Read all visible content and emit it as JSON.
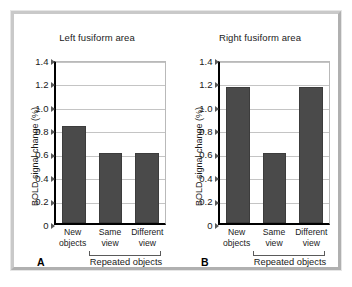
{
  "figure": {
    "frame_border_color": "#c9c9c9",
    "background": "#ffffff"
  },
  "chart_data": [
    {
      "type": "bar",
      "panel_letter": "A",
      "title": "Left fusiform area",
      "xlabel": "Repeated objects",
      "ylabel": "BOLD signal change (%)",
      "categories": [
        "New objects",
        "Same view",
        "Different view"
      ],
      "category_lines": [
        [
          "New",
          "objects"
        ],
        [
          "Same",
          "view"
        ],
        [
          "Different",
          "view"
        ]
      ],
      "values": [
        0.83,
        0.6,
        0.6
      ],
      "ylim": [
        0,
        1.4
      ],
      "yticks": [
        0,
        0.2,
        0.4,
        0.6,
        0.8,
        1.0,
        1.2,
        1.4
      ],
      "ytick_labels": [
        "0",
        "0.2",
        "0.4",
        "0.6",
        "0.8",
        "1.0",
        "1.2",
        "1.4"
      ],
      "grid": true,
      "legend": "none",
      "bar_color": "#4a4a4a",
      "group_bracket": {
        "label": "Repeated objects",
        "spans": [
          "Same view",
          "Different view"
        ]
      }
    },
    {
      "type": "bar",
      "panel_letter": "B",
      "title": "Right fusiform area",
      "xlabel": "Repeated objects",
      "ylabel": "BOLD signal change (%)",
      "categories": [
        "New objects",
        "Same view",
        "Different view"
      ],
      "category_lines": [
        [
          "New",
          "objects"
        ],
        [
          "Same",
          "view"
        ],
        [
          "Different",
          "view"
        ]
      ],
      "values": [
        1.16,
        0.6,
        1.16
      ],
      "ylim": [
        0,
        1.4
      ],
      "yticks": [
        0,
        0.2,
        0.4,
        0.6,
        0.8,
        1.0,
        1.2,
        1.4
      ],
      "ytick_labels": [
        "0",
        "0.2",
        "0.4",
        "0.6",
        "0.8",
        "1.0",
        "1.2",
        "1.4"
      ],
      "grid": true,
      "legend": "none",
      "bar_color": "#4a4a4a",
      "group_bracket": {
        "label": "Repeated objects",
        "spans": [
          "Same view",
          "Different view"
        ]
      }
    }
  ]
}
